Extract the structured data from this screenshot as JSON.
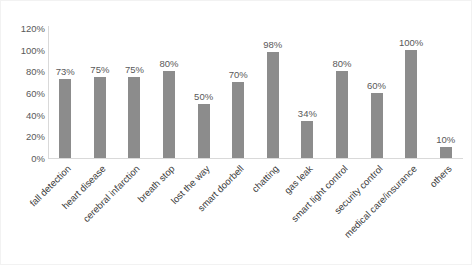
{
  "chart_data": {
    "type": "bar",
    "title": "",
    "xlabel": "",
    "ylabel": "",
    "ylim": [
      0,
      120
    ],
    "ytick_labels": [
      "120%",
      "100%",
      "80%",
      "60%",
      "40%",
      "20%",
      "0%"
    ],
    "ytick_values": [
      120,
      100,
      80,
      60,
      40,
      20,
      0
    ],
    "grid": false,
    "legend": "none",
    "bar_color": "#8c8c8c",
    "value_suffix": "%",
    "categories": [
      "fall detection",
      "heart disease",
      "cerebral infarction",
      "breath stop",
      "lost the way",
      "smart doorbell",
      "chatting",
      "gas leak",
      "smart light control",
      "security control",
      "medical care/insurance",
      "others"
    ],
    "values": [
      73,
      75,
      75,
      80,
      50,
      70,
      98,
      34,
      80,
      60,
      100,
      10
    ],
    "data_labels": [
      "73%",
      "75%",
      "75%",
      "80%",
      "50%",
      "70%",
      "98%",
      "34%",
      "80%",
      "60%",
      "100%",
      "10%"
    ]
  }
}
